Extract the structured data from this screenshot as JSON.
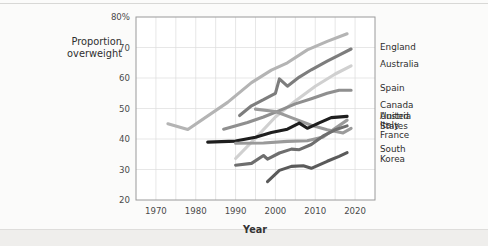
{
  "figure": {
    "y_axis_label_line1": "Proportion",
    "y_axis_label_line2": "overweight",
    "x_axis_title": "Year"
  },
  "chart_data": {
    "type": "line",
    "title": "",
    "xlabel": "Year",
    "ylabel": "Proportion overweight",
    "xlim": [
      1965,
      2025
    ],
    "ylim": [
      20,
      80
    ],
    "xticks": [
      1970,
      1980,
      1990,
      2000,
      2010,
      2020
    ],
    "xtick_labels": [
      "1970",
      "1980",
      "1990",
      "2000",
      "2010",
      "2020"
    ],
    "yticks": [
      20,
      30,
      40,
      50,
      60,
      70,
      80
    ],
    "ytick_labels": [
      "20",
      "30",
      "40",
      "50",
      "60",
      "70",
      "80%"
    ],
    "gridline_x_step": 5,
    "gridline_y_step": 10,
    "grid": true,
    "legend": "right-inline-labels",
    "series": [
      {
        "name": "United States",
        "label_lines": [
          "United",
          "States"
        ],
        "color": "#b4b4b4",
        "label_y": 46,
        "points": [
          [
            1973,
            45.0
          ],
          [
            1978,
            43.1
          ],
          [
            1988,
            52.0
          ],
          [
            1994,
            58.5
          ],
          [
            1999,
            62.6
          ],
          [
            2003,
            65.0
          ],
          [
            2008,
            69.2
          ],
          [
            2013,
            72.0
          ],
          [
            2018,
            74.5
          ]
        ]
      },
      {
        "name": "England",
        "label_lines": [
          "England"
        ],
        "color": "#7d7d7d",
        "label_y": 70.2,
        "points": [
          [
            1991,
            47.7
          ],
          [
            1994,
            50.9
          ],
          [
            1997,
            52.9
          ],
          [
            2000,
            55.0
          ],
          [
            2001,
            59.7
          ],
          [
            2003,
            57.3
          ],
          [
            2006,
            60.3
          ],
          [
            2009,
            62.7
          ],
          [
            2013,
            65.5
          ],
          [
            2016,
            67.5
          ],
          [
            2019,
            69.5
          ]
        ]
      },
      {
        "name": "Australia",
        "label_lines": [
          "Australia"
        ],
        "color": "#d0d0d0",
        "label_y": 64.5,
        "points": [
          [
            1990,
            33.6
          ],
          [
            1995,
            40.3
          ],
          [
            2000,
            47.2
          ],
          [
            2005,
            52.5
          ],
          [
            2010,
            57.3
          ],
          [
            2015,
            61.3
          ],
          [
            2019,
            64.0
          ]
        ]
      },
      {
        "name": "Spain",
        "label_lines": [
          "Spain"
        ],
        "color": "#8f8f8f",
        "label_y": 56.8,
        "points": [
          [
            1987,
            43.2
          ],
          [
            1993,
            45.4
          ],
          [
            1997,
            47.2
          ],
          [
            2001,
            49.3
          ],
          [
            2005,
            51.5
          ],
          [
            2009,
            53.2
          ],
          [
            2013,
            55.0
          ],
          [
            2016,
            56.0
          ],
          [
            2019,
            56.0
          ]
        ]
      },
      {
        "name": "Canada",
        "label_lines": [
          "Canada"
        ],
        "color": "#9b9b9b",
        "label_y": 51.3,
        "points": [
          [
            1995,
            49.8
          ],
          [
            2000,
            49.0
          ],
          [
            2004,
            47.0
          ],
          [
            2009,
            44.5
          ],
          [
            2013,
            43.0
          ],
          [
            2017,
            42.0
          ],
          [
            2019,
            43.5
          ]
        ]
      },
      {
        "name": "Austria",
        "label_lines": [
          "Austria"
        ],
        "color": "#1e1e1e",
        "label_y": 47.6,
        "points": [
          [
            1983,
            39.0
          ],
          [
            1990,
            39.3
          ],
          [
            1995,
            40.6
          ],
          [
            1999,
            42.1
          ],
          [
            2003,
            43.2
          ],
          [
            2006,
            45.2
          ],
          [
            2008,
            43.5
          ],
          [
            2011,
            45.3
          ],
          [
            2014,
            47.0
          ],
          [
            2018,
            47.4
          ]
        ]
      },
      {
        "name": "Italy",
        "label_lines": [
          "Italy"
        ],
        "color": "#9a9a9a",
        "label_y": 44.6,
        "points": [
          [
            1990,
            38.6
          ],
          [
            1997,
            38.7
          ],
          [
            2003,
            39.2
          ],
          [
            2008,
            39.4
          ],
          [
            2012,
            40.7
          ],
          [
            2015,
            43.5
          ],
          [
            2018,
            46.2
          ]
        ]
      },
      {
        "name": "France",
        "label_lines": [
          "France"
        ],
        "color": "#6e6e6e",
        "label_y": 41.3,
        "points": [
          [
            1990,
            31.4
          ],
          [
            1994,
            32.0
          ],
          [
            1997,
            34.6
          ],
          [
            1998,
            33.4
          ],
          [
            2001,
            35.4
          ],
          [
            2004,
            36.7
          ],
          [
            2006,
            36.5
          ],
          [
            2009,
            38.2
          ],
          [
            2012,
            41.0
          ],
          [
            2015,
            43.0
          ],
          [
            2018,
            44.3
          ]
        ]
      },
      {
        "name": "South Korea",
        "label_lines": [
          "South",
          "Korea"
        ],
        "color": "#5a5a5a",
        "label_y": 35.0,
        "points": [
          [
            1998,
            26.0
          ],
          [
            2001,
            29.7
          ],
          [
            2004,
            31.0
          ],
          [
            2007,
            31.2
          ],
          [
            2009,
            30.4
          ],
          [
            2013,
            32.7
          ],
          [
            2016,
            34.3
          ],
          [
            2018,
            35.5
          ]
        ]
      }
    ]
  }
}
